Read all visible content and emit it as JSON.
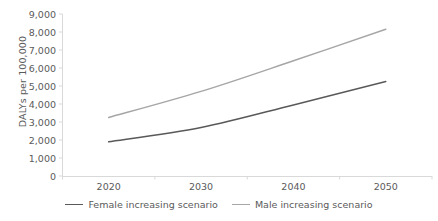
{
  "chart_data": {
    "type": "line",
    "title": "",
    "subtitle": "",
    "xlabel": "",
    "ylabel": "DALYs per 100,000",
    "categories": [
      "2020",
      "2030",
      "2040",
      "2050"
    ],
    "x": [
      2020,
      2030,
      2040,
      2050
    ],
    "xlim": [
      2015,
      2055
    ],
    "ylim": [
      0,
      9000
    ],
    "y_ticks": [
      "0",
      "1,000",
      "2,000",
      "3,000",
      "4,000",
      "5,000",
      "6,000",
      "7,000",
      "8,000",
      "9,000"
    ],
    "y_tick_values": [
      0,
      1000,
      2000,
      3000,
      4000,
      5000,
      6000,
      7000,
      8000,
      9000
    ],
    "grid": false,
    "legend_position": "bottom",
    "series": [
      {
        "name": "Female increasing scenario",
        "color": "#595959",
        "values": [
          1900,
          2700,
          3950,
          5250
        ]
      },
      {
        "name": "Male increasing scenario",
        "color": "#a6a6a6",
        "values": [
          3250,
          4700,
          6400,
          8150
        ]
      }
    ],
    "axis_color": "#d9d9d9",
    "text_color": "#5a5a5a"
  },
  "legend": {
    "items": [
      {
        "label": "Female increasing scenario"
      },
      {
        "label": "Male increasing scenario"
      }
    ]
  }
}
